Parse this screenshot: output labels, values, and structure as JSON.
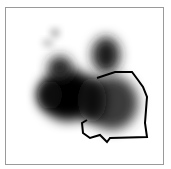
{
  "image": {
    "description": "Grayscale saliency/heat blob with an overlaid black contour outline inside a thin gray frame",
    "colors": {
      "background": "#ffffff",
      "frame": "#9a9a9a",
      "blob": "#000000",
      "contour": "#000000"
    }
  }
}
